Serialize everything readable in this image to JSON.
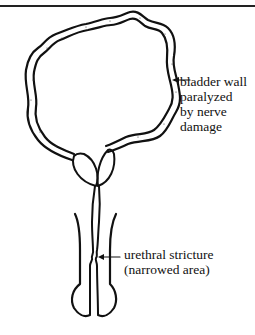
{
  "figure": {
    "title_rule": true,
    "colors": {
      "ink": "#111111",
      "background": "#ffffff",
      "wall_fill": "#ffffff"
    }
  },
  "labels": {
    "bladder_wall": {
      "lines": [
        "bladder wall",
        "paralyzed",
        "by nerve",
        "damage"
      ]
    },
    "urethral_stricture": {
      "lines": [
        "urethral stricture",
        "(narrowed area)"
      ]
    }
  },
  "parts": [
    {
      "name": "bladder",
      "description": "distended bladder with thick wavy wall"
    },
    {
      "name": "prostate",
      "description": "two lobes below bladder neck"
    },
    {
      "name": "urethra",
      "description": "narrow tube with constricted section"
    },
    {
      "name": "penis",
      "description": "shaft outline with glans at bottom"
    }
  ]
}
